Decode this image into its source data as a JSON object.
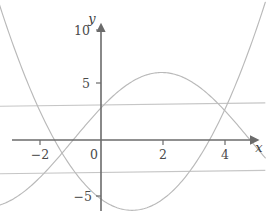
{
  "figure": {
    "background_color": "#ffffff",
    "axis_color": "#6b6b6b",
    "curve_color": "#b9b9b9",
    "aux_line_color": "#c6c6c6",
    "tick_label_color": "#4a4a4a",
    "x_axis_name": "x",
    "y_axis_name": "y"
  },
  "labels": {
    "y_10": "10",
    "y_5": "5",
    "y_0": "0",
    "y_minus5": "−5",
    "x_minus2": "−2",
    "x_2": "2",
    "x_4": "4"
  },
  "chart_data": {
    "type": "line",
    "title": "",
    "xlabel": "x",
    "ylabel": "y",
    "xlim": [
      -3.3,
      5.3
    ],
    "ylim": [
      -7.0,
      11.5
    ],
    "grid": false,
    "legend": "none",
    "xticks": [
      -2,
      0,
      2,
      4
    ],
    "xtick_labels": [
      "−2",
      "0",
      "2",
      "4"
    ],
    "yticks": [
      10,
      5,
      0,
      -5
    ],
    "ytick_labels": [
      "10",
      "5",
      "0",
      "−5"
    ],
    "series": [
      {
        "name": "parabola",
        "kind": "quadratic",
        "equation": "y = x^2 - 2x - 5.25",
        "vertex": [
          1,
          -6.25
        ],
        "roots": [
          -1.5,
          3.5
        ],
        "y_intercept": -5.25,
        "x": [
          -3.3,
          -3.0,
          -2.5,
          -2.0,
          -1.5,
          -1.0,
          -0.5,
          0.0,
          0.5,
          1.0,
          1.5,
          2.0,
          2.5,
          3.0,
          3.5,
          4.0,
          4.5,
          5.0,
          5.3
        ],
        "values": [
          12.4,
          9.75,
          6.0,
          2.75,
          0.0,
          -2.25,
          -4.0,
          -5.25,
          -6.0,
          -6.25,
          -6.0,
          -5.25,
          -4.0,
          -2.25,
          0.0,
          2.75,
          6.0,
          9.75,
          12.4
        ]
      },
      {
        "name": "sinusoid",
        "kind": "sine",
        "equation": "y = 6 sin(0.55(x + 0.9))",
        "peak": [
          1.0,
          6.0
        ],
        "trough": [
          -3.3,
          -5.9
        ],
        "y_intercept": 5.1,
        "x": [
          -3.3,
          -3.0,
          -2.5,
          -2.0,
          -1.5,
          -1.0,
          -0.5,
          0.0,
          0.5,
          1.0,
          1.5,
          2.0,
          2.5,
          3.0,
          3.5,
          4.0,
          4.5,
          5.0,
          5.3
        ],
        "values": [
          -5.9,
          -5.4,
          -4.3,
          -3.0,
          -1.6,
          -0.1,
          1.5,
          3.0,
          4.3,
          5.4,
          5.9,
          6.0,
          5.5,
          4.5,
          3.1,
          1.4,
          -0.4,
          -2.2,
          -3.2
        ]
      },
      {
        "name": "upper-auxiliary-line",
        "kind": "line",
        "equation": "y ≈ 3.1 + 0.03x",
        "x": [
          -3.3,
          5.3
        ],
        "values": [
          3.0,
          3.3
        ]
      },
      {
        "name": "lower-auxiliary-line",
        "kind": "line",
        "equation": "y ≈ -2.9 + 0.03x",
        "x": [
          -3.3,
          5.3
        ],
        "values": [
          -3.0,
          -2.7
        ]
      }
    ]
  }
}
